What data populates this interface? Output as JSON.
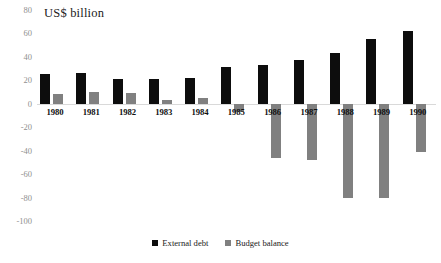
{
  "chart_data": {
    "type": "bar",
    "title": "US$ billion",
    "xlabel": "",
    "ylabel": "",
    "ylim": [
      -100,
      80
    ],
    "ytick_step": 20,
    "yticks": [
      80,
      60,
      40,
      20,
      0,
      -20,
      -40,
      -60,
      -80,
      -100
    ],
    "ytick_labels": [
      "80",
      "60",
      "40",
      "20",
      "0",
      "-20",
      "-40",
      "-60",
      "-80",
      "-100"
    ],
    "grid": false,
    "legend_position": "bottom",
    "categories": [
      "1980",
      "1981",
      "1982",
      "1983",
      "1984",
      "1985",
      "1986",
      "1987",
      "1988",
      "1989",
      "1990"
    ],
    "series": [
      {
        "name": "External debt",
        "color": "#0d0d0d",
        "values": [
          25,
          26,
          21,
          21,
          22,
          31,
          33,
          37,
          43,
          55,
          62
        ]
      },
      {
        "name": "Budget balance",
        "color": "#808080",
        "values": [
          8,
          10,
          9,
          3,
          5,
          -7,
          -46,
          -48,
          -80,
          -80,
          -41
        ]
      }
    ]
  },
  "legend": {
    "items": [
      {
        "label": "External debt",
        "marker": "square-marker",
        "color": "#0d0d0d"
      },
      {
        "label": "Budget balance",
        "marker": "square-marker",
        "color": "#808080"
      }
    ]
  },
  "axis": {
    "zero_line_color": "#d9d9d9",
    "tick_label_color": "#8f8f8f"
  }
}
